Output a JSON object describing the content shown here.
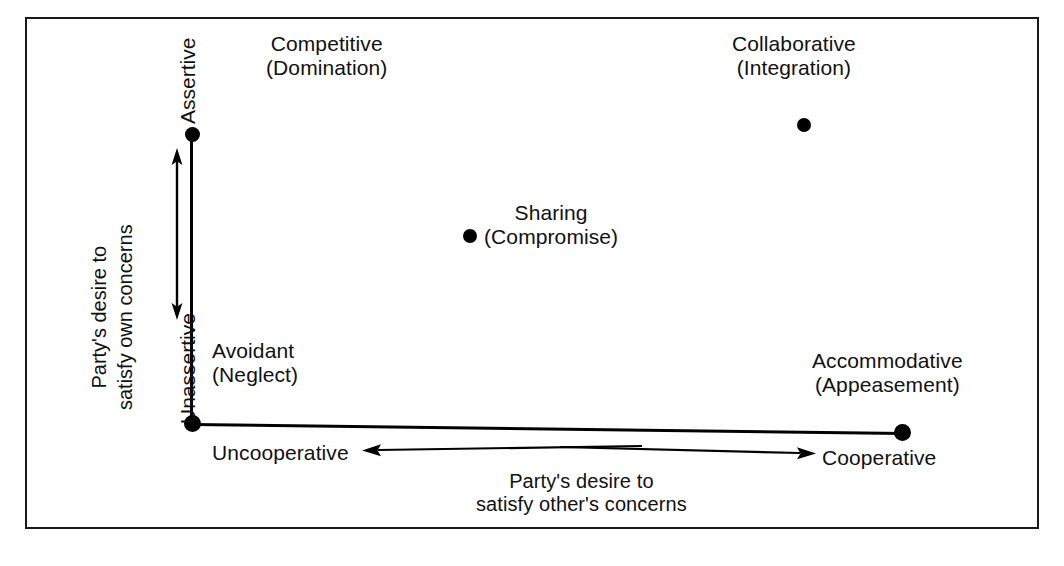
{
  "figure": {
    "type": "dual-concern-conflict-model",
    "frame_visible": true
  },
  "axes": {
    "y": {
      "title_line1": "Party's desire to",
      "title_line2": "satisfy own concerns",
      "high_label": "Assertive",
      "low_label": "Unassertive",
      "direction": "double-arrow-vertical"
    },
    "x": {
      "title_line1": "Party's desire to",
      "title_line2": "satisfy other's concerns",
      "low_label": "Uncooperative",
      "high_label": "Cooperative",
      "direction": "double-arrow-horizontal"
    }
  },
  "styles": [
    {
      "id": "competitive",
      "name": "Competitive",
      "alias": "(Domination)",
      "assertiveness": "high",
      "cooperativeness": "low",
      "has_dot": false
    },
    {
      "id": "collaborative",
      "name": "Collaborative",
      "alias": "(Integration)",
      "assertiveness": "high",
      "cooperativeness": "high",
      "has_dot": true
    },
    {
      "id": "sharing",
      "name": "Sharing",
      "alias": "(Compromise)",
      "assertiveness": "medium",
      "cooperativeness": "medium",
      "has_dot": true
    },
    {
      "id": "avoidant",
      "name": "Avoidant",
      "alias": "(Neglect)",
      "assertiveness": "low",
      "cooperativeness": "low",
      "has_dot": false
    },
    {
      "id": "accommodative",
      "name": "Accommodative",
      "alias": "(Appeasement)",
      "assertiveness": "low",
      "cooperativeness": "high",
      "has_dot": true
    }
  ],
  "colors": {
    "ink": "#000000",
    "text": "#111111",
    "background": "#ffffff",
    "frame": "#1a1a1a"
  }
}
